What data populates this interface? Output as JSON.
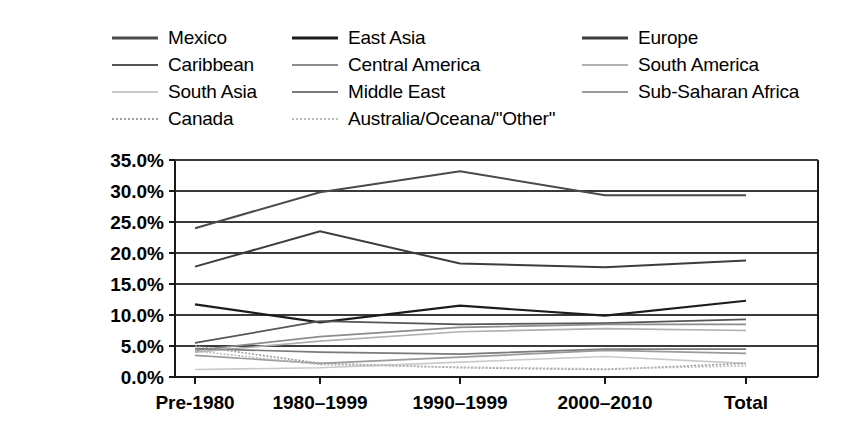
{
  "chart_data": {
    "type": "line",
    "title": "",
    "subtitle": "",
    "xlabel": "",
    "ylabel": "",
    "grid": true,
    "legend_position": "top",
    "legend_columns": 3,
    "categories": [
      "Pre-1980",
      "1980–1999",
      "1990–1999",
      "2000–2010",
      "Total"
    ],
    "ylim": [
      0,
      35
    ],
    "ytick_values": [
      0,
      5,
      10,
      15,
      20,
      25,
      30,
      35
    ],
    "ytick_labels": [
      "0.0%",
      "5.0%",
      "10.0%",
      "15.0%",
      "20.0%",
      "25.0%",
      "30.0%",
      "35.0%"
    ],
    "value_suffix": "%",
    "series": [
      {
        "name": "Mexico",
        "color": "#4a4a4a",
        "width": 2.0,
        "dash": "none",
        "values": [
          24.0,
          29.8,
          33.2,
          29.3,
          29.3
        ]
      },
      {
        "name": "East Asia",
        "color": "#1c1c1c",
        "width": 2.2,
        "dash": "none",
        "values": [
          11.7,
          8.8,
          11.5,
          9.9,
          12.3
        ]
      },
      {
        "name": "Europe",
        "color": "#3c3c3c",
        "width": 2.0,
        "dash": "none",
        "values": [
          17.8,
          23.5,
          18.3,
          17.7,
          18.8
        ]
      },
      {
        "name": "Caribbean",
        "color": "#555555",
        "width": 1.8,
        "dash": "none",
        "values": [
          5.5,
          9.0,
          8.5,
          8.7,
          9.3
        ]
      },
      {
        "name": "Central America",
        "color": "#8c8c8c",
        "width": 1.7,
        "dash": "none",
        "values": [
          4.3,
          6.5,
          8.0,
          8.5,
          8.5
        ]
      },
      {
        "name": "South America",
        "color": "#b0b0b0",
        "width": 1.7,
        "dash": "none",
        "values": [
          4.0,
          5.8,
          7.3,
          7.8,
          7.5
        ]
      },
      {
        "name": "South Asia",
        "color": "#c9c9c9",
        "width": 1.6,
        "dash": "none",
        "values": [
          1.2,
          1.5,
          2.4,
          3.3,
          2.2
        ]
      },
      {
        "name": "Middle East",
        "color": "#7a7a7a",
        "width": 1.7,
        "dash": "none",
        "values": [
          4.6,
          4.0,
          3.7,
          4.5,
          4.5
        ]
      },
      {
        "name": "Sub-Saharan Africa",
        "color": "#9a9a9a",
        "width": 1.7,
        "dash": "none",
        "values": [
          3.5,
          2.2,
          3.2,
          4.3,
          3.8
        ]
      },
      {
        "name": "Canada",
        "color": "#9e9e9e",
        "width": 1.6,
        "dash": "2,1.6",
        "values": [
          5.0,
          2.2,
          1.5,
          1.2,
          2.2
        ]
      },
      {
        "name": "Australia/Oceana/\"Other\"",
        "color": "#bdbdbd",
        "width": 1.6,
        "dash": "2,1.6",
        "values": [
          4.2,
          2.0,
          1.6,
          1.3,
          1.8
        ]
      }
    ]
  },
  "legend": {
    "rows": [
      {
        "items": [
          0,
          1,
          2
        ]
      },
      {
        "items": [
          3,
          4,
          5
        ]
      },
      {
        "items": [
          6,
          7,
          8
        ]
      },
      {
        "items": [
          9,
          10
        ]
      }
    ]
  },
  "axes": {
    "x_tick_positions_px": [
      195,
      320,
      460,
      605,
      746
    ],
    "plot_left_px": 175,
    "plot_right_px": 818,
    "plot_top_px": 160,
    "plot_bottom_px": 377
  }
}
